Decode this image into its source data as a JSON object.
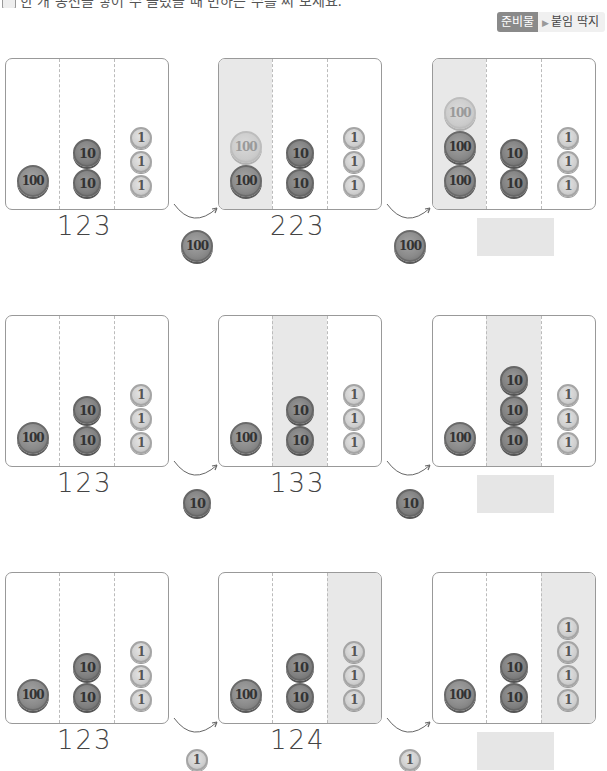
{
  "instruction": "한 개 동전을 넣어 수 올렸을 때 변하는 수를 써 보세요.",
  "badge": {
    "tag": "준비물",
    "material": "붙임 딱지",
    "arrow": "▶"
  },
  "rows": [
    {
      "panels": [
        {
          "highlight": -1,
          "hundreds": [
            "100"
          ],
          "tens": [
            "10",
            "10"
          ],
          "ones": [
            "1",
            "1",
            "1"
          ],
          "value": "123"
        },
        {
          "highlight": 0,
          "hundreds": [
            "100",
            "100-light"
          ],
          "tens": [
            "10",
            "10"
          ],
          "ones": [
            "1",
            "1",
            "1"
          ],
          "value": "223"
        },
        {
          "highlight": 0,
          "hundreds": [
            "100",
            "100",
            "100-light"
          ],
          "tens": [
            "10",
            "10"
          ],
          "ones": [
            "1",
            "1",
            "1"
          ],
          "value": ""
        }
      ],
      "added_coin": "100"
    },
    {
      "panels": [
        {
          "highlight": -1,
          "hundreds": [
            "100"
          ],
          "tens": [
            "10",
            "10"
          ],
          "ones": [
            "1",
            "1",
            "1"
          ],
          "value": "123"
        },
        {
          "highlight": 1,
          "hundreds": [
            "100"
          ],
          "tens": [
            "10",
            "10"
          ],
          "ones": [
            "1",
            "1",
            "1"
          ],
          "value": "133"
        },
        {
          "highlight": 1,
          "hundreds": [
            "100"
          ],
          "tens": [
            "10",
            "10",
            "10"
          ],
          "ones": [
            "1",
            "1",
            "1"
          ],
          "value": ""
        }
      ],
      "added_coin": "10"
    },
    {
      "panels": [
        {
          "highlight": -1,
          "hundreds": [
            "100"
          ],
          "tens": [
            "10",
            "10"
          ],
          "ones": [
            "1",
            "1",
            "1"
          ],
          "value": "123"
        },
        {
          "highlight": 2,
          "hundreds": [
            "100"
          ],
          "tens": [
            "10",
            "10"
          ],
          "ones": [
            "1",
            "1",
            "1"
          ],
          "value": "124"
        },
        {
          "highlight": 2,
          "hundreds": [
            "100"
          ],
          "tens": [
            "10",
            "10"
          ],
          "ones": [
            "1",
            "1",
            "1",
            "1"
          ],
          "value": ""
        }
      ],
      "added_coin": "1"
    }
  ],
  "colors": {
    "highlight": "#e8e8e8",
    "answer_box": "#e6e6e6",
    "badge_tag": "#8a8a8a"
  }
}
